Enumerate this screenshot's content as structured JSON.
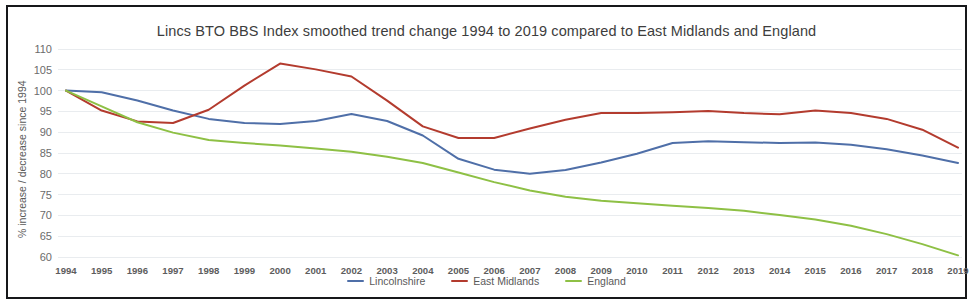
{
  "figure": {
    "title": "Lincs BTO BBS Index smoothed trend change 1994 to 2019 compared to East Midlands and England",
    "y_axis_title": "% increase / decrease since 1994"
  },
  "colors": {
    "lincolnshire": "#4f6fa8",
    "east_midlands": "#b33b2e",
    "england": "#8ec045",
    "gridline": "#e9ecef",
    "frame": "#17181a",
    "title_text": "#3d3d3d",
    "tick_text": "#5d5d5d"
  },
  "chart_data": {
    "type": "line",
    "title": "Lincs BTO BBS Index smoothed trend change 1994 to 2019 compared to East Midlands and England",
    "xlabel": "",
    "ylabel": "% increase / decrease since 1994",
    "grid": true,
    "legend_position": "bottom",
    "xlim": [
      1994,
      2019
    ],
    "ylim": [
      60,
      110
    ],
    "ytick_step": 5,
    "yticks": [
      110,
      105,
      100,
      95,
      90,
      85,
      80,
      75,
      70,
      65,
      60
    ],
    "categories": [
      "1994",
      "1995",
      "1996",
      "1997",
      "1998",
      "1999",
      "2000",
      "2001",
      "2002",
      "2003",
      "2004",
      "2005",
      "2006",
      "2007",
      "2008",
      "2009",
      "2010",
      "2011",
      "2012",
      "2013",
      "2014",
      "2015",
      "2016",
      "2017",
      "2018",
      "2019"
    ],
    "series": [
      {
        "name": "Lincolnshire",
        "color": "#4f6fa8",
        "values": [
          100.0,
          99.6,
          97.6,
          95.2,
          93.2,
          92.2,
          92.0,
          92.7,
          94.4,
          92.7,
          89.2,
          83.6,
          81.0,
          80.0,
          80.9,
          82.7,
          84.8,
          87.4,
          87.8,
          87.6,
          87.4,
          87.5,
          87.0,
          85.9,
          84.4,
          82.6
        ]
      },
      {
        "name": "East Midlands",
        "color": "#b33b2e",
        "values": [
          100.0,
          95.2,
          92.6,
          92.2,
          95.4,
          101.2,
          106.5,
          105.1,
          103.4,
          97.6,
          91.4,
          88.6,
          88.6,
          90.9,
          93.0,
          94.6,
          94.6,
          94.8,
          95.1,
          94.6,
          94.3,
          95.2,
          94.6,
          93.2,
          90.6,
          86.3
        ]
      },
      {
        "name": "England",
        "color": "#8ec045",
        "values": [
          100.0,
          96.2,
          92.4,
          89.9,
          88.1,
          87.4,
          86.8,
          86.1,
          85.3,
          84.1,
          82.6,
          80.3,
          78.0,
          76.0,
          74.5,
          73.5,
          72.9,
          72.3,
          71.8,
          71.1,
          70.1,
          69.0,
          67.5,
          65.5,
          63.1,
          60.4
        ]
      }
    ]
  },
  "legend": {
    "items": [
      {
        "label": "Lincolnshire",
        "color": "#4f6fa8"
      },
      {
        "label": "East Midlands",
        "color": "#b33b2e"
      },
      {
        "label": "England",
        "color": "#8ec045"
      }
    ]
  }
}
